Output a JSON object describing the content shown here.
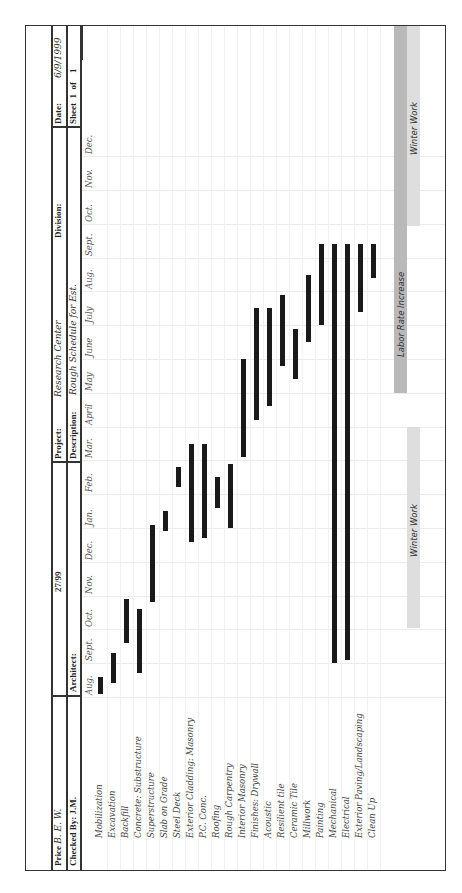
{
  "header": {
    "row1": {
      "price_label": "Price",
      "price_value": "B. E. W.",
      "doc_number": "27/99",
      "project_label": "Project:",
      "project_value": "Research Center",
      "division_label": "Division:",
      "date_label": "Date:",
      "date_value": "6/9/1999"
    },
    "row2": {
      "checked_label": "Checked By:",
      "checked_value": "J.M.",
      "architect_label": "Architect:",
      "description_label": "Description:",
      "description_value": "Rough Schedule for Est.",
      "sheet_label": "Sheet",
      "sheet_num": "1",
      "sheet_of": "of",
      "sheet_total": "1"
    }
  },
  "months": [
    "Aug.",
    "Sept.",
    "Oct.",
    "Nov.",
    "Dec.",
    "Jan.",
    "Feb.",
    "Mar.",
    "April",
    "May",
    "June",
    "July",
    "Aug.",
    "Sept.",
    "Oct.",
    "Nov.",
    "Dec."
  ],
  "tasks": [
    "Mobilization",
    "Excavation",
    "Backfill",
    "Concrete: Substructure",
    "Superstructure",
    "Slab on Grade",
    "Steel Deck",
    "Exterior Cladding: Masonry",
    "P.C. Conc.",
    "Roofing",
    "Rough Carpentry",
    "Interior Masonry",
    "Finishes: Drywall",
    "Acoustic",
    "Resilient tile",
    "Ceramic Tile",
    "Millwork",
    "Painting",
    "Mechanical",
    "Electrical",
    "Exterior Paving/Landscaping",
    "Clean Up"
  ],
  "bands": {
    "winter_work_1": "Winter Work",
    "labor_rate": "Labor Rate Increase",
    "winter_work_2": "Winter Work"
  },
  "colors": {
    "bar": "#1a1a1a",
    "labor_band": "#b9b9b9",
    "winter_band": "#dedede"
  },
  "chart_data": {
    "type": "gantt",
    "timeline": [
      "Aug.",
      "Sept.",
      "Oct.",
      "Nov.",
      "Dec.",
      "Jan.",
      "Feb.",
      "Mar.",
      "April",
      "May",
      "June",
      "July",
      "Aug.",
      "Sept.",
      "Oct.",
      "Nov.",
      "Dec."
    ],
    "tasks": [
      {
        "name": "Mobilization",
        "start": 0.1,
        "end": 0.6
      },
      {
        "name": "Excavation",
        "start": 0.4,
        "end": 1.3
      },
      {
        "name": "Backfill",
        "start": 1.6,
        "end": 2.9
      },
      {
        "name": "Concrete: Substructure",
        "start": 0.7,
        "end": 2.6
      },
      {
        "name": "Superstructure",
        "start": 2.8,
        "end": 5.1
      },
      {
        "name": "Slab on Grade",
        "start": 4.9,
        "end": 5.5
      },
      {
        "name": "Steel Deck",
        "start": 6.2,
        "end": 6.8
      },
      {
        "name": "Exterior Cladding: Masonry",
        "start": 4.6,
        "end": 7.5
      },
      {
        "name": "P.C. Conc.",
        "start": 4.7,
        "end": 7.5
      },
      {
        "name": "Roofing",
        "start": 5.6,
        "end": 6.5
      },
      {
        "name": "Rough Carpentry",
        "start": 5.0,
        "end": 6.9
      },
      {
        "name": "Interior Masonry",
        "start": 7.1,
        "end": 10.0
      },
      {
        "name": "Finishes: Drywall",
        "start": 8.2,
        "end": 11.5
      },
      {
        "name": "Acoustic",
        "start": 8.6,
        "end": 11.5
      },
      {
        "name": "Resilient tile",
        "start": 9.8,
        "end": 11.9
      },
      {
        "name": "Ceramic Tile",
        "start": 9.4,
        "end": 10.9
      },
      {
        "name": "Millwork",
        "start": 10.5,
        "end": 12.5
      },
      {
        "name": "Painting",
        "start": 11.0,
        "end": 13.4
      },
      {
        "name": "Mechanical",
        "start": 1.0,
        "end": 13.4
      },
      {
        "name": "Electrical",
        "start": 1.1,
        "end": 13.4
      },
      {
        "name": "Exterior Paving/Landscaping",
        "start": 11.4,
        "end": 13.4
      },
      {
        "name": "Clean Up",
        "start": 12.4,
        "end": 13.4
      }
    ],
    "bands": [
      {
        "label": "Winter Work",
        "start": 2.6,
        "end": 7.6
      },
      {
        "label": "Labor Rate Increase",
        "start": 8.5,
        "end": 17
      },
      {
        "label": "Winter Work",
        "start": 13.4,
        "end": 17
      }
    ]
  }
}
